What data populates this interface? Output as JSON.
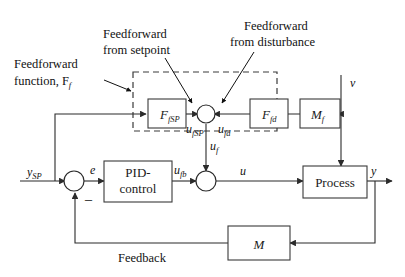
{
  "diagram": {
    "annotations": {
      "ff_function_line1": "Feedforward",
      "ff_function_line2": "function, F",
      "ff_function_sub": "f",
      "ff_setpoint_line1": "Feedforward",
      "ff_setpoint_line2": "from setpoint",
      "ff_disturbance_line1": "Feedforward",
      "ff_disturbance_line2": "from disturbance",
      "feedback_label": "Feedback"
    },
    "blocks": [
      {
        "id": "f_fsp",
        "label": "F",
        "sub": "fSP",
        "name": "block-f-fsp"
      },
      {
        "id": "f_fd",
        "label": "F",
        "sub": "fd",
        "name": "block-f-fd"
      },
      {
        "id": "m_f",
        "label": "M",
        "sub": "f",
        "name": "block-mf"
      },
      {
        "id": "pid",
        "label_line1": "PID-",
        "label_line2": "control",
        "name": "block-pid"
      },
      {
        "id": "process",
        "label": "Process",
        "name": "block-process"
      },
      {
        "id": "m",
        "label": "M",
        "name": "block-m"
      }
    ],
    "signals": {
      "y_sp": "y",
      "y_sp_sub": "SP",
      "error": "e",
      "u_fsp": "u",
      "u_fsp_sub": "fSP",
      "u_fd": "u",
      "u_fd_sub": "fd",
      "u_f": "u",
      "u_f_sub": "f",
      "u_fb": "u",
      "u_fb_sub": "fb",
      "u": "u",
      "y": "y",
      "v": "v",
      "minus": "_"
    },
    "colors": {
      "line": "#2b2b2b",
      "box_stroke": "#3a3a3a",
      "text": "#111111",
      "background": "#ffffff"
    }
  }
}
